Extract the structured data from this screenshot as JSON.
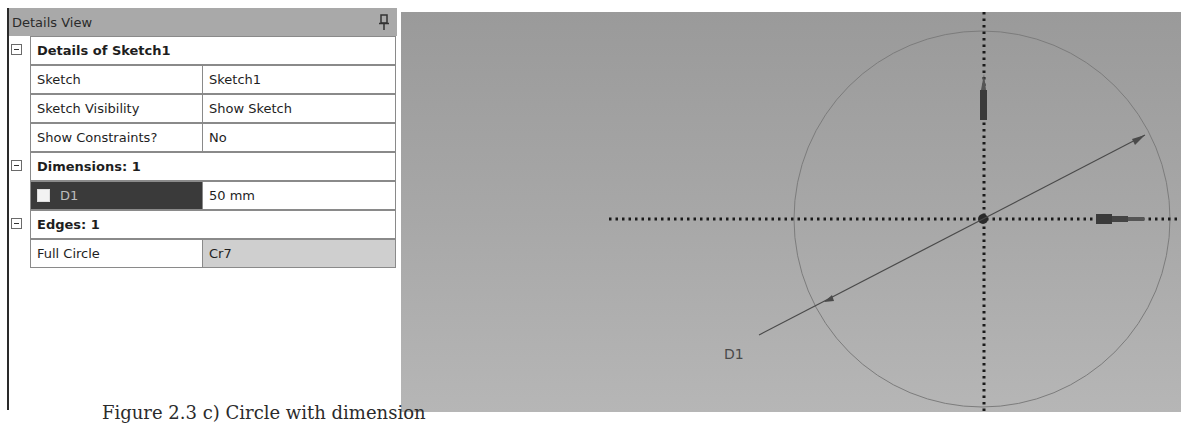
{
  "details_view": {
    "title": "Details View",
    "pin_icon": "pushpin-icon",
    "groups": [
      {
        "label": "Details of Sketch1",
        "expanded": true,
        "rows": [
          {
            "key": "Sketch",
            "value": "Sketch1"
          },
          {
            "key": "Sketch Visibility",
            "value": "Show Sketch"
          },
          {
            "key": "Show Constraints?",
            "value": "No"
          }
        ]
      },
      {
        "label": "Dimensions: 1",
        "expanded": true,
        "rows": [
          {
            "key": "D1",
            "value": "50 mm",
            "checkbox": false,
            "selected": true
          }
        ]
      },
      {
        "label": "Edges: 1",
        "expanded": true,
        "rows": [
          {
            "key": "Full Circle",
            "value": "Cr7"
          }
        ]
      }
    ]
  },
  "graphics": {
    "dimension_label": "D1",
    "entities": [
      "circle",
      "diameter-dimension",
      "x-axis",
      "y-axis",
      "origin"
    ]
  },
  "caption": "Figure 2.3 c) Circle with dimension"
}
